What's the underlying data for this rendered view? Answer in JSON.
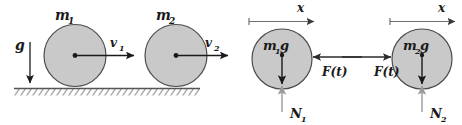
{
  "figure": {
    "width": 462,
    "height": 125,
    "background_color": "#ffffff"
  },
  "colors": {
    "disk_fill": "#c9c9c9",
    "disk_stroke": "#4d4d4d",
    "ink": "#1a1a1a",
    "axis_line": "#707070",
    "normal_arrow": "#9a9a9a",
    "force_arrow": "#6e6e6e",
    "ground_line": "#555555",
    "hatch": "#7a7a7a"
  },
  "panels": [
    {
      "id": "kinematic-panel",
      "name": "rolling-disks-on-ground",
      "ground": {
        "label": "hatched-ground",
        "y": 88
      },
      "gravity": {
        "label": "g",
        "subscript": "",
        "direction": "down",
        "arrow_color": "#1a1a1a"
      },
      "bodies": [
        {
          "id": "disk-1",
          "mass_label": "m",
          "mass_subscript": "1",
          "cx": 75,
          "cy": 55,
          "r": 31,
          "velocity": {
            "label": "v",
            "subscript": "1",
            "direction": "right",
            "arrow_color": "#1a1a1a"
          }
        },
        {
          "id": "disk-2",
          "mass_label": "m",
          "mass_subscript": "2",
          "cx": 176,
          "cy": 55,
          "r": 31,
          "velocity": {
            "label": "v",
            "subscript": "2",
            "direction": "right",
            "arrow_color": "#1a1a1a"
          }
        }
      ]
    },
    {
      "id": "fbd-panel-1",
      "name": "free-body-diagram-mass-1",
      "axis": {
        "label": "x",
        "direction": "right",
        "tick_at_origin": true,
        "color": "#707070"
      },
      "body": {
        "id": "disk-3",
        "cx": 282,
        "cy": 59,
        "r": 30,
        "weight": {
          "label_mass": "m",
          "label_subscript": "1",
          "label_g": "g",
          "full_label": "m1g",
          "direction": "down",
          "arrow_color": "#1a1a1a"
        },
        "normal": {
          "label": "N",
          "subscript": "1",
          "direction": "up",
          "arrow_color": "#9a9a9a"
        },
        "applied_force": {
          "label": "F(t)",
          "direction": "left",
          "arrow_color": "#6e6e6e",
          "note": "acts on mass 1 pointing left"
        }
      }
    },
    {
      "id": "fbd-panel-2",
      "name": "free-body-diagram-mass-2",
      "axis": {
        "label": "x",
        "direction": "right",
        "tick_at_origin": true,
        "color": "#707070"
      },
      "body": {
        "id": "disk-4",
        "cx": 422,
        "cy": 59,
        "r": 30,
        "weight": {
          "label_mass": "m",
          "label_subscript": "2",
          "label_g": "g",
          "full_label": "m2g",
          "direction": "down",
          "arrow_color": "#1a1a1a"
        },
        "normal": {
          "label": "N",
          "subscript": "2",
          "direction": "up",
          "arrow_color": "#9a9a9a"
        },
        "applied_force": {
          "label": "F(t)",
          "direction": "right",
          "arrow_color": "#6e6e6e",
          "note": "reaction on mass 2 pointing right"
        }
      }
    }
  ],
  "labels": {
    "m1": "m",
    "m1_sub": "1",
    "m2": "m",
    "m2_sub": "2",
    "v1": "v",
    "v1_sub": "1",
    "v2": "v",
    "v2_sub": "2",
    "g": "g",
    "x1": "x",
    "x2": "x",
    "m1g_m": "m",
    "m1g_sub": "1",
    "m1g_g": "g",
    "m2g_m": "m",
    "m2g_sub": "2",
    "m2g_g": "g",
    "N1": "N",
    "N1_sub": "1",
    "N2": "N",
    "N2_sub": "2",
    "Ft_left": "F(t)",
    "Ft_right": "F(t)"
  }
}
